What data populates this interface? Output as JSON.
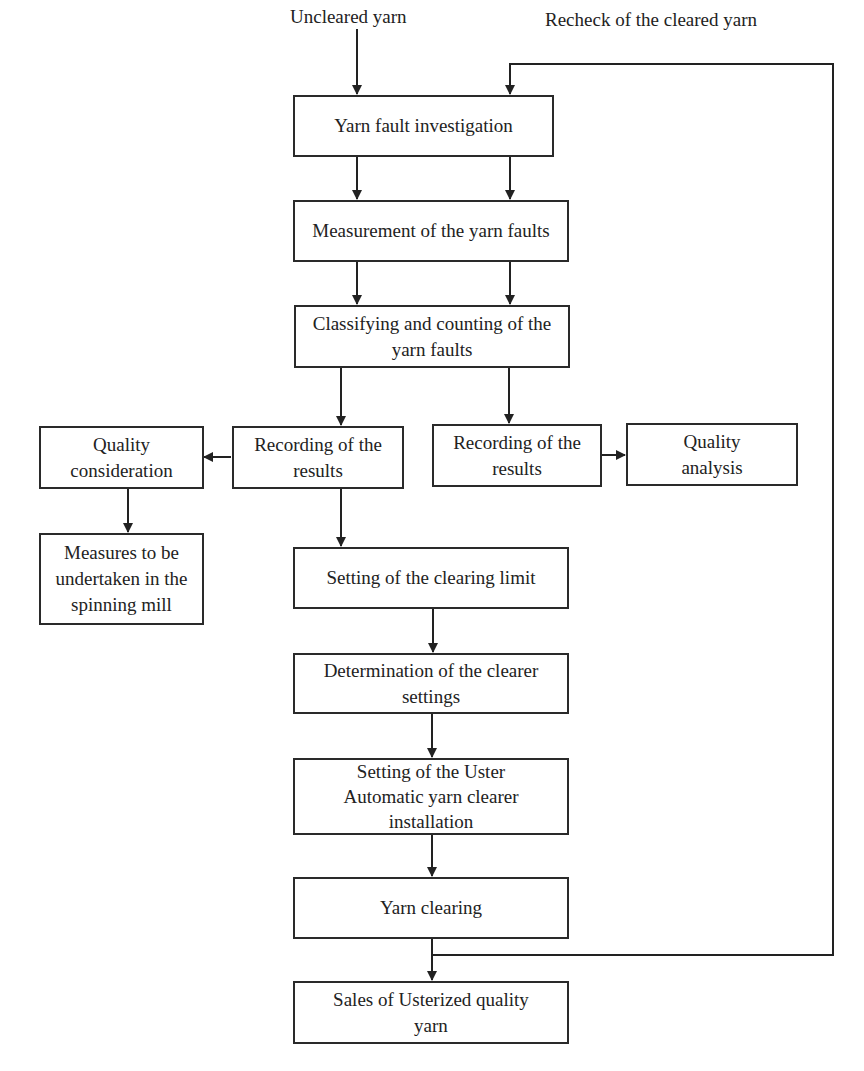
{
  "diagram": {
    "type": "flowchart",
    "inputs": {
      "uncleared": "Uncleared yarn",
      "recheck": "Recheck of the cleared yarn"
    },
    "nodes": {
      "investigation": "Yarn fault investigation",
      "measurement": "Measurement of the yarn faults",
      "classifying": "Classifying and counting of the yarn faults",
      "recording_left": "Recording of the results",
      "recording_right": "Recording of the results",
      "quality_consideration": "Quality consideration",
      "quality_analysis": "Quality analysis",
      "measures": "Measures to be undertaken in the spinning mill",
      "clearing_limit": "Setting of the clearing limit",
      "clearer_settings": "Determination of the clearer settings",
      "uster_setting": "Setting of the Uster Automatic yarn clearer installation",
      "yarn_clearing": "Yarn clearing",
      "sales": "Sales of Usterized quality yarn"
    },
    "edges": [
      [
        "Uncleared yarn",
        "Yarn fault investigation"
      ],
      [
        "Recheck of the cleared yarn",
        "Yarn fault investigation"
      ],
      [
        "Yarn fault investigation",
        "Measurement of the yarn faults"
      ],
      [
        "Measurement of the yarn faults",
        "Classifying and counting of the yarn faults"
      ],
      [
        "Classifying and counting of the yarn faults",
        "Recording of the results (left)"
      ],
      [
        "Classifying and counting of the yarn faults",
        "Recording of the results (right)"
      ],
      [
        "Recording of the results (left)",
        "Quality consideration"
      ],
      [
        "Quality consideration",
        "Measures to be undertaken in the spinning mill"
      ],
      [
        "Recording of the results (right)",
        "Quality analysis"
      ],
      [
        "Recording of the results (left)",
        "Setting of the clearing limit"
      ],
      [
        "Setting of the clearing limit",
        "Determination of the clearer settings"
      ],
      [
        "Determination of the clearer settings",
        "Setting of the Uster Automatic yarn clearer installation"
      ],
      [
        "Setting of the Uster Automatic yarn clearer installation",
        "Yarn clearing"
      ],
      [
        "Yarn clearing",
        "Sales of Usterized quality yarn"
      ],
      [
        "Yarn clearing",
        "Recheck of the cleared yarn"
      ]
    ]
  }
}
